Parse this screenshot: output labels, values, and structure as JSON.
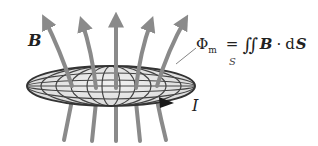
{
  "diagram": {
    "labels": {
      "field": "B",
      "current": "I",
      "surface_subscript": "S"
    },
    "formula": {
      "phi": "Φ",
      "phi_subscript": "m",
      "equals": "=",
      "integral": "∬",
      "field_vector": "B",
      "dot": "·",
      "differential": "d",
      "area_vector": "S"
    },
    "field_lines_count": 5,
    "colors": {
      "field_line": "#8a8a8a",
      "loop_outline": "#333333",
      "loop_fill": "#e6e6e6",
      "grid": "#444444",
      "text": "#222222"
    }
  }
}
